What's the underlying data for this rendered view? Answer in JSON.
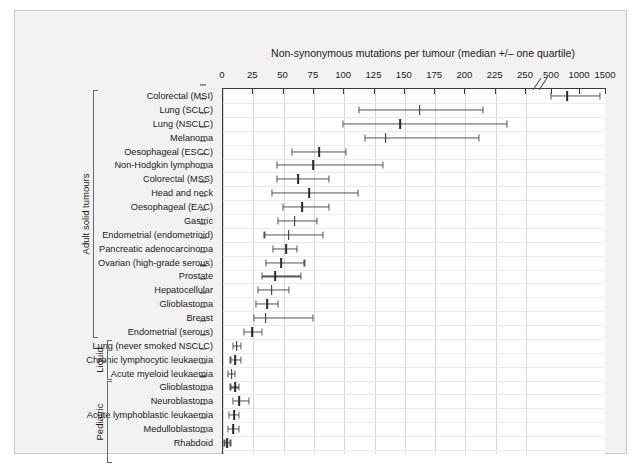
{
  "figure": {
    "title": "Non-synonymous mutations per tumour (median +/– one quartile)",
    "background_color": "#f2f2f2",
    "plot_background_color": "#ffffff",
    "axis_color": "#3a3a3a",
    "marker_color": "#555555"
  },
  "chart_data": {
    "type": "scatter",
    "title": "Non-synonymous mutations per tumour (median +/– one quartile)",
    "xlabel": "Non-synonymous mutations per tumour",
    "ylabel": "",
    "orientation": "horizontal",
    "error_type": "interquartile range (lower quartile, median, upper quartile)",
    "grid": true,
    "legend": "none",
    "axis_break": {
      "after": 250,
      "before": 500,
      "note": "x-axis compressed after 250"
    },
    "xticks": [
      0,
      25,
      50,
      75,
      100,
      125,
      150,
      175,
      200,
      225,
      250,
      500,
      1000,
      1500
    ],
    "xtick_labels": [
      "0",
      "25",
      "50",
      "75",
      "100",
      "125",
      "150",
      "175",
      "200",
      "225",
      "250",
      "500",
      "1000",
      "1500"
    ],
    "xlim": [
      0,
      1500
    ],
    "groups": [
      {
        "name": "Adult solid tumours",
        "start": 0,
        "end": 17
      },
      {
        "name": "Liquid",
        "start": 18,
        "end": 20
      },
      {
        "name": "Pediatric",
        "start": 21,
        "end": 26
      }
    ],
    "categories": [
      "Colorectal (MSI)",
      "Lung (SCLC)",
      "Lung (NSCLC)",
      "Melanoma",
      "Oesophageal (ESCC)",
      "Non-Hodgkin lymphoma",
      "Colorectal (MSS)",
      "Head and neck",
      "Oesophageal (EAC)",
      "Gastric",
      "Endometrial (endometrioid)",
      "Pancreatic adenocarcinoma",
      "Ovarian (high-grade serous)",
      "Prostate",
      "Hepatocellular",
      "Glioblastoma",
      "Breast",
      "Endometrial (serous)",
      "Lung (never smoked NSCLC)",
      "Chronic lymphocytic leukaemia",
      "Acute myeloid leukaemia",
      "Glioblastoma",
      "Neuroblastoma",
      "Acute lymphoblastic leukaemia",
      "Medulloblastoma",
      "Rhabdoid"
    ],
    "lower": [
      500,
      113,
      100,
      118,
      58,
      45,
      45,
      41,
      50,
      46,
      35,
      42,
      36,
      33,
      30,
      28,
      26,
      18,
      9,
      7,
      5,
      7,
      9,
      6,
      5,
      2
    ],
    "median": [
      790,
      163,
      147,
      135,
      80,
      75,
      63,
      72,
      66,
      60,
      55,
      53,
      49,
      44,
      41,
      37,
      36,
      25,
      12,
      11,
      8,
      11,
      14,
      10,
      9,
      4
    ],
    "upper": [
      1400,
      215,
      235,
      212,
      102,
      133,
      88,
      112,
      88,
      78,
      83,
      62,
      68,
      65,
      55,
      46,
      75,
      33,
      16,
      16,
      11,
      14,
      22,
      14,
      14,
      7
    ]
  }
}
